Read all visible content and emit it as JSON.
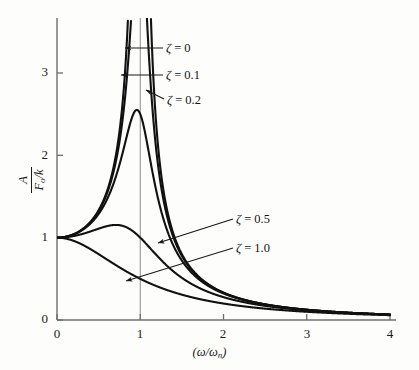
{
  "figure": {
    "background_color": "#fdfdfb",
    "axis_color": "#6f6f6f",
    "curve_color": "#111111"
  },
  "axes": {
    "x_title": "(ω/ω",
    "x_title_sub": "n",
    "x_title_close": ")",
    "y_numerator": "A",
    "y_denominator": "F",
    "y_denominator_sub": "o",
    "y_denominator_rest": "/k",
    "x_ticks": [
      "0",
      "1",
      "2",
      "3",
      "4"
    ],
    "y_ticks": [
      "0",
      "1",
      "2",
      "3"
    ]
  },
  "labels": {
    "zeta0": {
      "zeta": "ζ",
      "eq": " = 0"
    },
    "zeta01": {
      "zeta": "ζ",
      "eq": " = 0.1"
    },
    "zeta02": {
      "zeta": "ζ",
      "eq": " = 0.2"
    },
    "zeta05": {
      "zeta": "ζ",
      "eq": " = 0.5"
    },
    "zeta10": {
      "zeta": "ζ",
      "eq": " = 1.0"
    }
  },
  "chart_data": {
    "type": "line",
    "title": "",
    "xlabel": "(ω/ωn)",
    "ylabel": "A / (Fo/k)",
    "xlim": [
      0,
      4.08
    ],
    "ylim": [
      0,
      3.62
    ],
    "grid": false,
    "legend_position": "inline-annotations",
    "reference_lines": [
      {
        "axis": "x",
        "value": 1.0,
        "color": "#8a8a8a"
      }
    ],
    "formula": "A/(Fo/k) = 1 / sqrt((1 - r^2)^2 + (2*zeta*r)^2)",
    "x_tick_values": [
      0,
      1,
      2,
      3,
      4
    ],
    "y_tick_values": [
      0,
      1,
      2,
      3
    ],
    "x": [
      0,
      0.1,
      0.2,
      0.3,
      0.4,
      0.5,
      0.6,
      0.7,
      0.8,
      0.85,
      0.9,
      0.95,
      1.0,
      1.05,
      1.1,
      1.2,
      1.3,
      1.4,
      1.5,
      1.6,
      1.8,
      2.0,
      2.25,
      2.5,
      2.75,
      3.0,
      3.25,
      3.5,
      3.75,
      4.0
    ],
    "series": [
      {
        "name": "ζ = 0",
        "zeta": 0,
        "peak_value": null,
        "peak_x": 1.0,
        "clipped_top": true,
        "values": [
          1.0,
          1.01,
          1.04,
          1.1,
          1.19,
          1.33,
          1.56,
          1.96,
          2.78,
          3.6,
          5.26,
          10.26,
          null,
          9.76,
          4.76,
          2.27,
          1.45,
          1.08,
          0.8,
          0.64,
          0.45,
          0.33,
          0.25,
          0.19,
          0.15,
          0.125,
          0.1,
          0.09,
          0.08,
          0.067
        ]
      },
      {
        "name": "ζ = 0.1",
        "zeta": 0.1,
        "peak_value": 5.03,
        "peak_x": 0.99,
        "clipped_top": true,
        "values": [
          1.0,
          1.01,
          1.04,
          1.1,
          1.19,
          1.33,
          1.55,
          1.93,
          2.71,
          3.45,
          4.81,
          5.0,
          5.0,
          4.47,
          3.38,
          2.13,
          1.41,
          1.06,
          0.79,
          0.63,
          0.45,
          0.33,
          0.25,
          0.19,
          0.15,
          0.124,
          0.104,
          0.089,
          0.077,
          0.066
        ]
      },
      {
        "name": "ζ = 0.2",
        "zeta": 0.2,
        "peak_value": 2.55,
        "peak_x": 0.96,
        "clipped_top": false,
        "values": [
          1.0,
          1.01,
          1.04,
          1.09,
          1.18,
          1.3,
          1.49,
          1.79,
          2.22,
          2.4,
          2.52,
          2.55,
          2.5,
          2.33,
          2.1,
          1.63,
          1.25,
          0.98,
          0.77,
          0.62,
          0.44,
          0.32,
          0.245,
          0.19,
          0.15,
          0.123,
          0.103,
          0.088,
          0.077,
          0.066
        ]
      },
      {
        "name": "ζ = 0.5",
        "zeta": 0.5,
        "peak_value": 1.155,
        "peak_x": 0.707,
        "clipped_top": false,
        "values": [
          1.0,
          1.0,
          1.02,
          1.05,
          1.08,
          1.11,
          1.14,
          1.155,
          1.14,
          1.12,
          1.09,
          1.05,
          1.0,
          0.95,
          0.89,
          0.78,
          0.67,
          0.58,
          0.5,
          0.44,
          0.34,
          0.27,
          0.21,
          0.17,
          0.14,
          0.12,
          0.1,
          0.086,
          0.075,
          0.065
        ]
      },
      {
        "name": "ζ = 1.0",
        "zeta": 1.0,
        "peak_value": 1.0,
        "peak_x": 0.0,
        "clipped_top": false,
        "values": [
          1.0,
          0.98,
          0.96,
          0.92,
          0.86,
          0.8,
          0.74,
          0.67,
          0.61,
          0.58,
          0.55,
          0.52,
          0.5,
          0.47,
          0.45,
          0.41,
          0.37,
          0.33,
          0.31,
          0.28,
          0.24,
          0.2,
          0.17,
          0.14,
          0.12,
          0.1,
          0.088,
          0.077,
          0.068,
          0.06
        ]
      }
    ],
    "annotations": [
      {
        "text": "ζ = 0",
        "x_px": 168,
        "y_px": 47,
        "arrow": "left-horizontal"
      },
      {
        "text": "ζ = 0.1",
        "x_px": 168,
        "y_px": 73,
        "arrow": "left-horizontal"
      },
      {
        "text": "ζ = 0.2",
        "x_px": 168,
        "y_px": 100,
        "arrow": "left-down-to-curve"
      },
      {
        "text": "ζ = 0.5",
        "x_px": 238,
        "y_px": 215,
        "arrow": "left-down-to-curve"
      },
      {
        "text": "ζ = 1.0",
        "x_px": 238,
        "y_px": 243,
        "arrow": "left-down-to-curve"
      }
    ]
  }
}
